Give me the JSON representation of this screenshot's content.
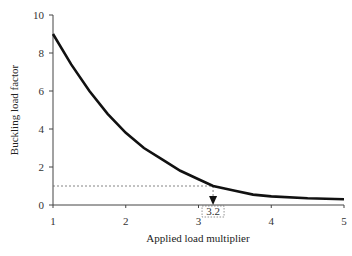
{
  "chart_data": {
    "type": "line",
    "title": "",
    "xlabel": "Applied load multiplier",
    "ylabel": "Buckling load factor",
    "xlim": [
      1,
      5
    ],
    "ylim": [
      0,
      10
    ],
    "xticks": [
      "1",
      "2",
      "3",
      "4",
      "5"
    ],
    "yticks": [
      "0",
      "2",
      "4",
      "6",
      "8",
      "10"
    ],
    "grid": false,
    "series": [
      {
        "name": "Buckling load factor",
        "x": [
          1.0,
          1.25,
          1.5,
          1.75,
          2.0,
          2.25,
          2.5,
          2.75,
          3.0,
          3.2,
          3.5,
          3.75,
          4.0,
          4.5,
          5.0
        ],
        "y": [
          9.0,
          7.4,
          6.0,
          4.8,
          3.8,
          3.0,
          2.4,
          1.8,
          1.35,
          1.0,
          0.75,
          0.55,
          0.45,
          0.35,
          0.3
        ]
      }
    ],
    "reference_line": {
      "y": 1.0,
      "style": "dotted"
    },
    "annotation": {
      "x": 3.2,
      "label": "3.2",
      "arrow": "down"
    }
  }
}
